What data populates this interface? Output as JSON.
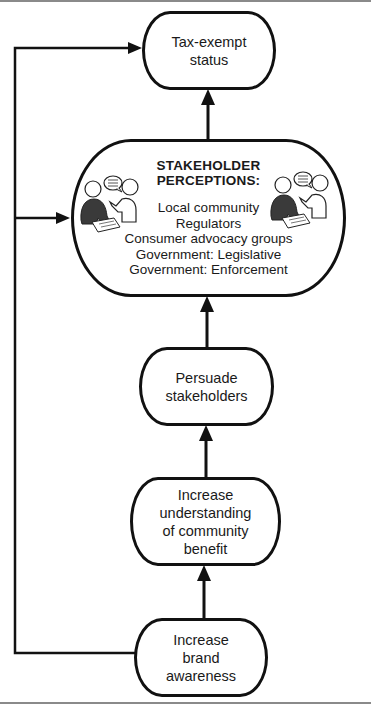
{
  "diagram": {
    "nodes": {
      "tax_exempt": {
        "lines": [
          "Tax-exempt",
          "status"
        ]
      },
      "stakeholder": {
        "title_lines": [
          "STAKEHOLDER",
          "PERCEPTIONS:"
        ],
        "items": [
          "Local community",
          "Regulators",
          "Consumer advocacy groups",
          "Government: Legislative",
          "Government: Enforcement"
        ],
        "icons": [
          "people-conversation-icon",
          "people-conversation-icon"
        ]
      },
      "persuade": {
        "lines": [
          "Persuade",
          "stakeholders"
        ]
      },
      "understanding": {
        "lines": [
          "Increase",
          "understanding",
          "of community",
          "benefit"
        ]
      },
      "brand": {
        "lines": [
          "Increase",
          "brand",
          "awareness"
        ]
      }
    },
    "edges": [
      {
        "from": "brand",
        "to": "understanding"
      },
      {
        "from": "understanding",
        "to": "persuade"
      },
      {
        "from": "persuade",
        "to": "stakeholder"
      },
      {
        "from": "stakeholder",
        "to": "tax_exempt"
      },
      {
        "from": "brand",
        "to": "stakeholder",
        "type": "feedback"
      },
      {
        "from": "brand",
        "to": "tax_exempt",
        "type": "feedback"
      }
    ],
    "colors": {
      "stroke": "#111111",
      "fill": "#ffffff",
      "figure_dark": "#3a3a3a"
    }
  }
}
